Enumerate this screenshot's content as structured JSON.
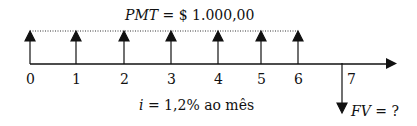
{
  "diagram": {
    "title_pmt": "PMT = $ 1.000,00",
    "pmt_var": "PMT",
    "pmt_rest": " = $ 1.000,00",
    "rate_var": "i",
    "rate_rest": " = 1,2% ao mês",
    "fv_var": "FV",
    "fv_rest": " = ?",
    "periods": [
      "0",
      "1",
      "2",
      "3",
      "4",
      "5",
      "6",
      "7"
    ],
    "colors": {
      "line": "#111111"
    }
  }
}
